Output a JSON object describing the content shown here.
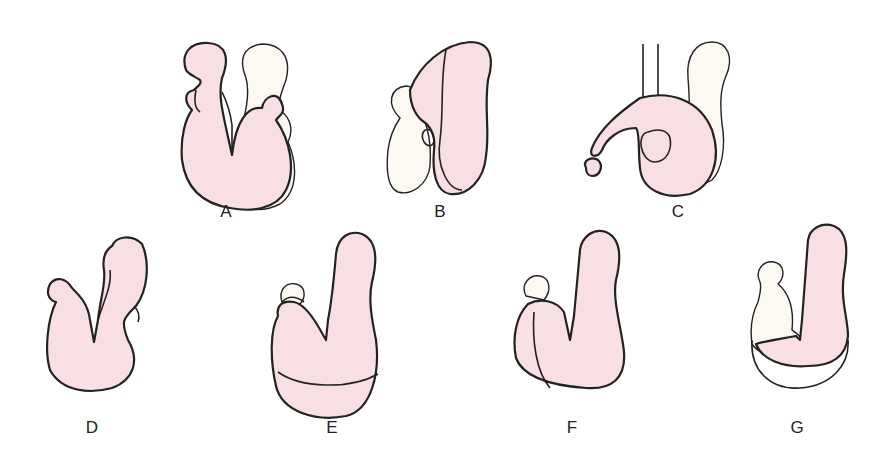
{
  "panels": [
    {
      "id": "A",
      "label": "A",
      "x": 226,
      "y": 212
    },
    {
      "id": "B",
      "label": "B",
      "x": 440,
      "y": 212
    },
    {
      "id": "C",
      "label": "C",
      "x": 678,
      "y": 212
    },
    {
      "id": "D",
      "label": "D",
      "x": 92,
      "y": 428
    },
    {
      "id": "E",
      "label": "E",
      "x": 332,
      "y": 428
    },
    {
      "id": "F",
      "label": "F",
      "x": 572,
      "y": 428
    },
    {
      "id": "G",
      "label": "G",
      "x": 797,
      "y": 428
    }
  ],
  "colors": {
    "fill_pink": "#f7dfe3",
    "fill_cream": "#fbf9f1",
    "stroke": "#222222"
  }
}
